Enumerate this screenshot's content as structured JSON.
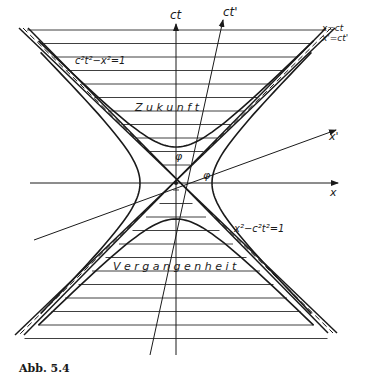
{
  "figure": {
    "caption": "Abb. 5.4",
    "axes": {
      "ct": "ct",
      "ct_prime": "ct'",
      "x": "x",
      "x_prime": "x'"
    },
    "light_cone_labels": {
      "unprimed": "x=ct",
      "primed": "x'=ct'"
    },
    "hyperbola_labels": {
      "timelike": "c²t²−x²=1",
      "spacelike": "x²−c²t²=1"
    },
    "regions": {
      "future": "Z u k u n f t",
      "past": "V e r g a n g e n h e i t"
    },
    "angle_label": "φ",
    "colors": {
      "ink": "#1a1a1a",
      "background": "#ffffff"
    }
  }
}
